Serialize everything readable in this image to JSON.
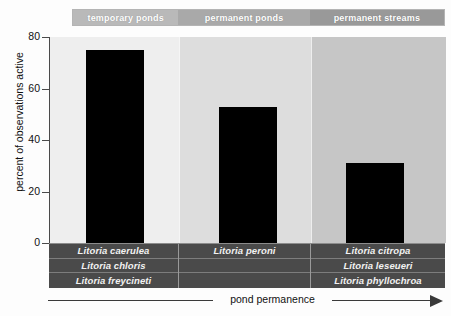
{
  "chart_data": {
    "type": "bar",
    "title": "",
    "xlabel": "pond permanence",
    "ylabel": "percent of observations active",
    "categories": [
      "temporary ponds",
      "permanent ponds",
      "permanent streams"
    ],
    "values": [
      75,
      53,
      31
    ],
    "ylim": [
      0,
      80
    ],
    "yticks": [
      "0",
      "20",
      "40",
      "60",
      "80"
    ],
    "ytick_values": [
      0,
      20,
      40,
      60,
      80
    ],
    "grid": false,
    "legend": "none",
    "bar_color": "#000000",
    "panel_colors": [
      "#eeeeee",
      "#dddddd",
      "#c6c6c6"
    ],
    "header_colors": [
      "#b9b9b9",
      "#a9a9a9",
      "#999999"
    ],
    "group_species": [
      [
        "Litoria caerulea",
        "Litoria chloris",
        "Litoria freycineti"
      ],
      [
        "Litoria peroni",
        "",
        ""
      ],
      [
        "Litoria citropa",
        "Litoria leseueri",
        "Litoria phyllochroa"
      ]
    ]
  },
  "header": {
    "cells": [
      {
        "label": "temporary ponds"
      },
      {
        "label": "permanent ponds"
      },
      {
        "label": "permanent streams"
      }
    ]
  },
  "yaxis": {
    "label": "percent of observations active",
    "ticks": [
      {
        "label": "80"
      },
      {
        "label": "60"
      },
      {
        "label": "40"
      },
      {
        "label": "20"
      },
      {
        "label": "0"
      }
    ]
  },
  "xaxis": {
    "label": "pond permanence",
    "arrow": "right-arrow-icon"
  },
  "species_table": {
    "col1": [
      {
        "name": "Litoria caerulea"
      },
      {
        "name": "Litoria chloris"
      },
      {
        "name": "Litoria freycineti"
      }
    ],
    "col2": [
      {
        "name": "Litoria peroni"
      },
      {
        "name": ""
      },
      {
        "name": ""
      }
    ],
    "col3": [
      {
        "name": "Litoria citropa"
      },
      {
        "name": "Litoria leseueri"
      },
      {
        "name": "Litoria phyllochroa"
      }
    ]
  }
}
